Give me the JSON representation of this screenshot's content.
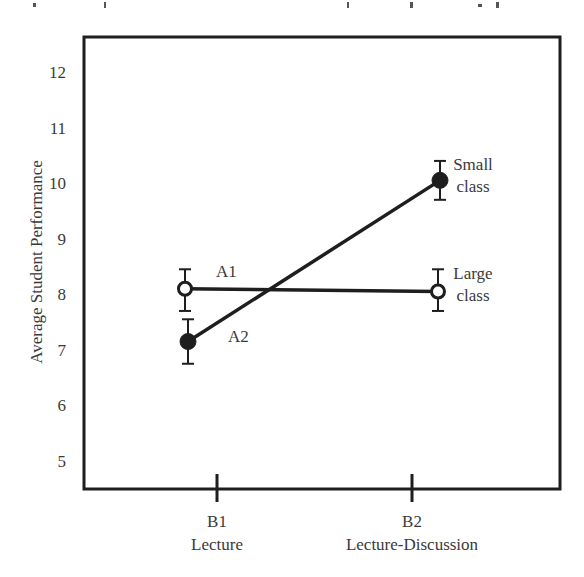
{
  "chart_data": {
    "type": "line",
    "title": "",
    "xlabel": "",
    "ylabel": "Average Student Performance",
    "ylim": [
      4.6,
      12.6
    ],
    "yticks": [
      5,
      6,
      7,
      8,
      9,
      10,
      11,
      12
    ],
    "grid": false,
    "categories": [
      {
        "code": "B1",
        "name": "Lecture"
      },
      {
        "code": "B2",
        "name": "Lecture-Discussion"
      }
    ],
    "series": [
      {
        "name": "A1",
        "end_label": [
          "Large",
          "class"
        ],
        "marker": "open-circle",
        "values": [
          8.1,
          8.05
        ],
        "error": [
          [
            7.7,
            8.45
          ],
          [
            7.7,
            8.45
          ]
        ]
      },
      {
        "name": "A2",
        "end_label": [
          "Small",
          "class"
        ],
        "marker": "filled-circle",
        "values": [
          7.15,
          10.05
        ],
        "error": [
          [
            6.75,
            7.55
          ],
          [
            9.7,
            10.4
          ]
        ]
      }
    ],
    "legend": "inline labels at line ends"
  },
  "colors": {
    "ink": "#1e1e1e",
    "text": "#3a3a3a",
    "background": "#ffffff"
  }
}
